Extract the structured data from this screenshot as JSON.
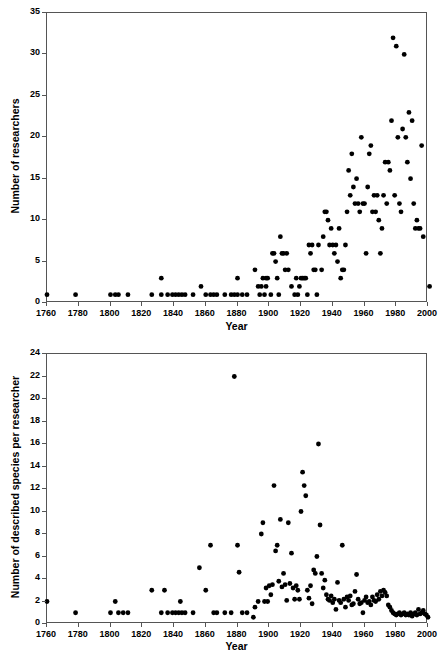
{
  "figure": {
    "background_color": "#ffffff",
    "marker_color": "#000000",
    "axis_color": "#555555",
    "panels": [
      "a",
      "b"
    ]
  },
  "panel_a": {
    "tag": "a",
    "ylabel": "Number of researchers",
    "xlabel": "Year",
    "y_ticks": [
      "0",
      "5",
      "10",
      "15",
      "20",
      "25",
      "30",
      "35"
    ],
    "x_ticks": [
      "1760",
      "1780",
      "1800",
      "1820",
      "1840",
      "1860",
      "1880",
      "1900",
      "1920",
      "1940",
      "1960",
      "1980",
      "2000"
    ]
  },
  "panel_b": {
    "tag": "b",
    "ylabel": "Number of described species per researcher",
    "xlabel": "Year",
    "y_ticks": [
      "0",
      "2",
      "4",
      "6",
      "8",
      "10",
      "12",
      "14",
      "16",
      "18",
      "20",
      "22",
      "24"
    ],
    "x_ticks": [
      "1760",
      "1780",
      "1800",
      "1820",
      "1840",
      "1860",
      "1880",
      "1900",
      "1920",
      "1940",
      "1960",
      "1980",
      "2000"
    ]
  },
  "chart_data": [
    {
      "type": "scatter",
      "panel": "a",
      "title": "a",
      "xlabel": "Year",
      "ylabel": "Number of researchers",
      "xlim": [
        1760,
        2000
      ],
      "ylim": [
        0,
        35
      ],
      "xticks": [
        1760,
        1780,
        1800,
        1820,
        1840,
        1860,
        1880,
        1900,
        1920,
        1940,
        1960,
        1980,
        2000
      ],
      "yticks": [
        0,
        5,
        10,
        15,
        20,
        25,
        30,
        35
      ],
      "grid": false,
      "legend": null,
      "marker": "filled-circle",
      "points": [
        [
          1760,
          1
        ],
        [
          1778,
          1
        ],
        [
          1800,
          1
        ],
        [
          1803,
          1
        ],
        [
          1805,
          1
        ],
        [
          1811,
          1
        ],
        [
          1826,
          1
        ],
        [
          1832,
          3
        ],
        [
          1832,
          1
        ],
        [
          1836,
          1
        ],
        [
          1839,
          1
        ],
        [
          1841,
          1
        ],
        [
          1843,
          1
        ],
        [
          1845,
          1
        ],
        [
          1847,
          1
        ],
        [
          1852,
          1
        ],
        [
          1857,
          2
        ],
        [
          1860,
          1
        ],
        [
          1863,
          1
        ],
        [
          1865,
          1
        ],
        [
          1867,
          1
        ],
        [
          1872,
          1
        ],
        [
          1876,
          1
        ],
        [
          1878,
          1
        ],
        [
          1880,
          3
        ],
        [
          1880,
          1
        ],
        [
          1883,
          1
        ],
        [
          1886,
          1
        ],
        [
          1891,
          4
        ],
        [
          1893,
          2
        ],
        [
          1894,
          1
        ],
        [
          1895,
          2
        ],
        [
          1896,
          3
        ],
        [
          1897,
          1
        ],
        [
          1898,
          3
        ],
        [
          1898,
          2
        ],
        [
          1899,
          3
        ],
        [
          1901,
          1
        ],
        [
          1902,
          6
        ],
        [
          1903,
          6
        ],
        [
          1904,
          5
        ],
        [
          1905,
          3
        ],
        [
          1906,
          1
        ],
        [
          1907,
          8
        ],
        [
          1908,
          6
        ],
        [
          1909,
          6
        ],
        [
          1910,
          4
        ],
        [
          1911,
          6
        ],
        [
          1912,
          4
        ],
        [
          1914,
          2
        ],
        [
          1916,
          1
        ],
        [
          1917,
          3
        ],
        [
          1918,
          1
        ],
        [
          1919,
          2
        ],
        [
          1920,
          3
        ],
        [
          1921,
          3
        ],
        [
          1922,
          3
        ],
        [
          1923,
          3
        ],
        [
          1924,
          1
        ],
        [
          1925,
          7
        ],
        [
          1926,
          6
        ],
        [
          1927,
          7
        ],
        [
          1928,
          4
        ],
        [
          1929,
          4
        ],
        [
          1930,
          1
        ],
        [
          1931,
          7
        ],
        [
          1933,
          4
        ],
        [
          1934,
          8
        ],
        [
          1935,
          11
        ],
        [
          1936,
          11
        ],
        [
          1937,
          10
        ],
        [
          1938,
          7
        ],
        [
          1939,
          9
        ],
        [
          1940,
          7
        ],
        [
          1941,
          6
        ],
        [
          1942,
          7
        ],
        [
          1943,
          5
        ],
        [
          1944,
          9
        ],
        [
          1945,
          3
        ],
        [
          1946,
          4
        ],
        [
          1947,
          4
        ],
        [
          1948,
          7
        ],
        [
          1949,
          11
        ],
        [
          1950,
          16
        ],
        [
          1951,
          13
        ],
        [
          1952,
          18
        ],
        [
          1953,
          14
        ],
        [
          1954,
          12
        ],
        [
          1955,
          15
        ],
        [
          1956,
          12
        ],
        [
          1957,
          11
        ],
        [
          1958,
          20
        ],
        [
          1959,
          12
        ],
        [
          1960,
          12
        ],
        [
          1961,
          6
        ],
        [
          1962,
          14
        ],
        [
          1963,
          18
        ],
        [
          1964,
          19
        ],
        [
          1965,
          11
        ],
        [
          1966,
          13
        ],
        [
          1967,
          11
        ],
        [
          1968,
          13
        ],
        [
          1969,
          10
        ],
        [
          1970,
          6
        ],
        [
          1971,
          9
        ],
        [
          1972,
          13
        ],
        [
          1973,
          17
        ],
        [
          1974,
          12
        ],
        [
          1975,
          17
        ],
        [
          1976,
          16
        ],
        [
          1977,
          22
        ],
        [
          1978,
          32
        ],
        [
          1979,
          13
        ],
        [
          1980,
          31
        ],
        [
          1981,
          20
        ],
        [
          1982,
          12
        ],
        [
          1983,
          11
        ],
        [
          1984,
          21
        ],
        [
          1985,
          30
        ],
        [
          1986,
          20
        ],
        [
          1987,
          17
        ],
        [
          1988,
          23
        ],
        [
          1989,
          15
        ],
        [
          1990,
          22
        ],
        [
          1991,
          12
        ],
        [
          1992,
          9
        ],
        [
          1993,
          10
        ],
        [
          1994,
          9
        ],
        [
          1995,
          9
        ],
        [
          1996,
          19
        ],
        [
          1997,
          8
        ],
        [
          2001,
          2
        ]
      ]
    },
    {
      "type": "scatter",
      "panel": "b",
      "title": "b",
      "xlabel": "Year",
      "ylabel": "Number of described species per researcher",
      "xlim": [
        1760,
        2000
      ],
      "ylim": [
        0,
        24
      ],
      "xticks": [
        1760,
        1780,
        1800,
        1820,
        1840,
        1860,
        1880,
        1900,
        1920,
        1940,
        1960,
        1980,
        2000
      ],
      "yticks": [
        0,
        2,
        4,
        6,
        8,
        10,
        12,
        14,
        16,
        18,
        20,
        22,
        24
      ],
      "grid": false,
      "legend": null,
      "marker": "filled-circle",
      "points": [
        [
          1760,
          2
        ],
        [
          1778,
          1
        ],
        [
          1800,
          1
        ],
        [
          1803,
          2
        ],
        [
          1805,
          1
        ],
        [
          1808,
          1
        ],
        [
          1811,
          1
        ],
        [
          1826,
          3
        ],
        [
          1832,
          1
        ],
        [
          1834,
          3
        ],
        [
          1836,
          1
        ],
        [
          1839,
          1
        ],
        [
          1841,
          1
        ],
        [
          1843,
          1
        ],
        [
          1844,
          2
        ],
        [
          1845,
          1
        ],
        [
          1847,
          1
        ],
        [
          1852,
          1
        ],
        [
          1856,
          5
        ],
        [
          1860,
          3
        ],
        [
          1863,
          7
        ],
        [
          1865,
          1
        ],
        [
          1867,
          1
        ],
        [
          1872,
          1
        ],
        [
          1876,
          1
        ],
        [
          1878,
          22
        ],
        [
          1880,
          7
        ],
        [
          1881,
          4.6
        ],
        [
          1883,
          1
        ],
        [
          1886,
          1
        ],
        [
          1890,
          0.6
        ],
        [
          1891,
          1.5
        ],
        [
          1893,
          2
        ],
        [
          1895,
          8
        ],
        [
          1896,
          9
        ],
        [
          1897,
          2
        ],
        [
          1898,
          3.2
        ],
        [
          1899,
          2
        ],
        [
          1900,
          3.4
        ],
        [
          1901,
          2.6
        ],
        [
          1902,
          3.5
        ],
        [
          1903,
          12.3
        ],
        [
          1904,
          6.5
        ],
        [
          1905,
          7
        ],
        [
          1906,
          3.8
        ],
        [
          1907,
          9.3
        ],
        [
          1908,
          3.3
        ],
        [
          1909,
          4.5
        ],
        [
          1910,
          3.5
        ],
        [
          1911,
          2.1
        ],
        [
          1912,
          9
        ],
        [
          1913,
          3.6
        ],
        [
          1914,
          6.3
        ],
        [
          1915,
          3.2
        ],
        [
          1916,
          2.2
        ],
        [
          1917,
          3.4
        ],
        [
          1918,
          3
        ],
        [
          1919,
          2.2
        ],
        [
          1920,
          10
        ],
        [
          1921,
          13.5
        ],
        [
          1922,
          12.3
        ],
        [
          1923,
          11.4
        ],
        [
          1924,
          3
        ],
        [
          1925,
          2.3
        ],
        [
          1926,
          3.4
        ],
        [
          1927,
          1.8
        ],
        [
          1928,
          4.8
        ],
        [
          1929,
          4.5
        ],
        [
          1930,
          6
        ],
        [
          1931,
          16
        ],
        [
          1932,
          8.8
        ],
        [
          1933,
          4.5
        ],
        [
          1934,
          3.2
        ],
        [
          1935,
          3.9
        ],
        [
          1936,
          2.6
        ],
        [
          1937,
          2.2
        ],
        [
          1938,
          2.1
        ],
        [
          1939,
          2.5
        ],
        [
          1940,
          1.9
        ],
        [
          1941,
          2.2
        ],
        [
          1942,
          1.3
        ],
        [
          1943,
          3.7
        ],
        [
          1944,
          2.1
        ],
        [
          1945,
          1.9
        ],
        [
          1946,
          7
        ],
        [
          1947,
          2.2
        ],
        [
          1948,
          1.5
        ],
        [
          1949,
          2.4
        ],
        [
          1950,
          2.1
        ],
        [
          1951,
          2.5
        ],
        [
          1952,
          1.7
        ],
        [
          1953,
          1.8
        ],
        [
          1954,
          2.9
        ],
        [
          1955,
          4.4
        ],
        [
          1956,
          2.2
        ],
        [
          1957,
          1.8
        ],
        [
          1958,
          1.9
        ],
        [
          1959,
          1.0
        ],
        [
          1960,
          2.1
        ],
        [
          1961,
          2.4
        ],
        [
          1962,
          1.9
        ],
        [
          1963,
          2.0
        ],
        [
          1964,
          1.7
        ],
        [
          1965,
          2.4
        ],
        [
          1966,
          2.1
        ],
        [
          1967,
          2.0
        ],
        [
          1968,
          2.6
        ],
        [
          1969,
          2.2
        ],
        [
          1970,
          2.9
        ],
        [
          1971,
          2.5
        ],
        [
          1972,
          3.0
        ],
        [
          1973,
          2.8
        ],
        [
          1974,
          2.5
        ],
        [
          1975,
          1.7
        ],
        [
          1976,
          1.5
        ],
        [
          1977,
          1.2
        ],
        [
          1978,
          1.0
        ],
        [
          1979,
          0.9
        ],
        [
          1980,
          0.8
        ],
        [
          1981,
          0.9
        ],
        [
          1982,
          1.0
        ],
        [
          1983,
          0.8
        ],
        [
          1984,
          0.9
        ],
        [
          1985,
          1.0
        ],
        [
          1986,
          0.8
        ],
        [
          1987,
          0.9
        ],
        [
          1988,
          0.8
        ],
        [
          1989,
          1.0
        ],
        [
          1990,
          0.7
        ],
        [
          1991,
          0.9
        ],
        [
          1992,
          1.0
        ],
        [
          1993,
          0.8
        ],
        [
          1994,
          1.3
        ],
        [
          1995,
          0.9
        ],
        [
          1996,
          1.0
        ],
        [
          1997,
          1.2
        ],
        [
          1998,
          0.9
        ],
        [
          1999,
          0.8
        ],
        [
          2000,
          0.6
        ]
      ]
    }
  ]
}
